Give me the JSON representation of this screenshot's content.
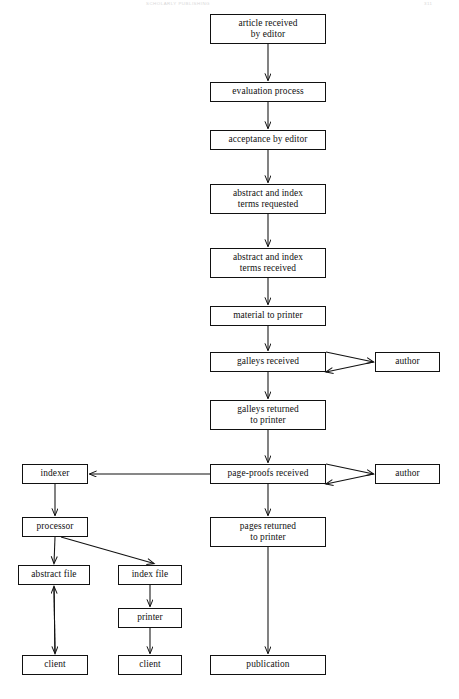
{
  "page": {
    "width": 459,
    "height": 699,
    "background": "#ffffff",
    "ink_color": "#111111"
  },
  "header": {
    "left_text": "SCHOLARLY PUBLISHING",
    "right_text": "311"
  },
  "chart_data": {
    "type": "diagram",
    "nodes": [
      {
        "id": "article_received",
        "label": "article received\nby editor",
        "x": 210,
        "y": 14,
        "w": 116,
        "h": 30
      },
      {
        "id": "evaluation",
        "label": "evaluation process",
        "x": 210,
        "y": 82,
        "w": 116,
        "h": 20
      },
      {
        "id": "acceptance",
        "label": "acceptance by editor",
        "x": 210,
        "y": 130,
        "w": 116,
        "h": 20
      },
      {
        "id": "terms_requested",
        "label": "abstract and index\nterms requested",
        "x": 210,
        "y": 184,
        "w": 116,
        "h": 30
      },
      {
        "id": "terms_received",
        "label": "abstract and index\nterms received",
        "x": 210,
        "y": 248,
        "w": 116,
        "h": 30
      },
      {
        "id": "material_printer",
        "label": "material to printer",
        "x": 210,
        "y": 306,
        "w": 116,
        "h": 20
      },
      {
        "id": "galleys_received",
        "label": "galleys received",
        "x": 210,
        "y": 352,
        "w": 116,
        "h": 20
      },
      {
        "id": "author_galleys",
        "label": "author",
        "x": 375,
        "y": 352,
        "w": 65,
        "h": 20
      },
      {
        "id": "galleys_returned",
        "label": "galleys returned\nto printer",
        "x": 210,
        "y": 400,
        "w": 116,
        "h": 30
      },
      {
        "id": "page_proofs",
        "label": "page-proofs received",
        "x": 210,
        "y": 464,
        "w": 116,
        "h": 20
      },
      {
        "id": "author_proofs",
        "label": "author",
        "x": 375,
        "y": 464,
        "w": 65,
        "h": 20
      },
      {
        "id": "indexer",
        "label": "indexer",
        "x": 22,
        "y": 464,
        "w": 66,
        "h": 20
      },
      {
        "id": "pages_returned",
        "label": "pages returned\nto printer",
        "x": 210,
        "y": 517,
        "w": 116,
        "h": 30
      },
      {
        "id": "processor",
        "label": "processor",
        "x": 22,
        "y": 517,
        "w": 66,
        "h": 20
      },
      {
        "id": "abstract_file",
        "label": "abstract file",
        "x": 18,
        "y": 565,
        "w": 72,
        "h": 20
      },
      {
        "id": "index_file",
        "label": "index file",
        "x": 118,
        "y": 565,
        "w": 64,
        "h": 20
      },
      {
        "id": "printer",
        "label": "printer",
        "x": 118,
        "y": 608,
        "w": 64,
        "h": 20
      },
      {
        "id": "client_abstract",
        "label": "client",
        "x": 22,
        "y": 655,
        "w": 66,
        "h": 20
      },
      {
        "id": "client_index",
        "label": "client",
        "x": 118,
        "y": 655,
        "w": 64,
        "h": 20
      },
      {
        "id": "publication",
        "label": "publication",
        "x": 210,
        "y": 655,
        "w": 116,
        "h": 20
      }
    ],
    "edges": [
      {
        "from": "article_received",
        "to": "evaluation",
        "kind": "arrow-down"
      },
      {
        "from": "evaluation",
        "to": "acceptance",
        "kind": "arrow-down"
      },
      {
        "from": "acceptance",
        "to": "terms_requested",
        "kind": "arrow-down"
      },
      {
        "from": "terms_requested",
        "to": "terms_received",
        "kind": "arrow-down"
      },
      {
        "from": "terms_received",
        "to": "material_printer",
        "kind": "arrow-down"
      },
      {
        "from": "material_printer",
        "to": "galleys_received",
        "kind": "arrow-down"
      },
      {
        "from": "galleys_received",
        "to": "author_galleys",
        "kind": "double-arrow-horizontal"
      },
      {
        "from": "galleys_received",
        "to": "galleys_returned",
        "kind": "arrow-down"
      },
      {
        "from": "galleys_returned",
        "to": "page_proofs",
        "kind": "arrow-down"
      },
      {
        "from": "page_proofs",
        "to": "author_proofs",
        "kind": "double-arrow-horizontal"
      },
      {
        "from": "page_proofs",
        "to": "indexer",
        "kind": "arrow-left"
      },
      {
        "from": "page_proofs",
        "to": "pages_returned",
        "kind": "arrow-down"
      },
      {
        "from": "indexer",
        "to": "processor",
        "kind": "arrow-down"
      },
      {
        "from": "processor",
        "to": "abstract_file",
        "kind": "arrow-down"
      },
      {
        "from": "processor",
        "to": "index_file",
        "kind": "arrow-diagonal"
      },
      {
        "from": "abstract_file",
        "to": "client_abstract",
        "kind": "double-arrow-vertical"
      },
      {
        "from": "index_file",
        "to": "printer",
        "kind": "arrow-down"
      },
      {
        "from": "printer",
        "to": "client_index",
        "kind": "arrow-down"
      },
      {
        "from": "pages_returned",
        "to": "publication",
        "kind": "arrow-down"
      }
    ]
  }
}
